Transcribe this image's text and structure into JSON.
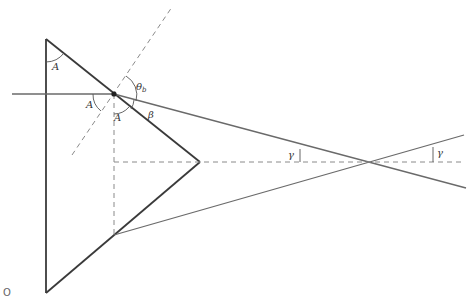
{
  "diagram": {
    "labels": {
      "apex_angle_top": "A",
      "apex_angle_left": "A",
      "apex_angle_bottom": "A",
      "theta_b": "θ",
      "theta_b_sub": "b",
      "beta": "β",
      "gamma_left": "γ",
      "gamma_right": "γ",
      "origin": "O"
    },
    "colors": {
      "prism": "#3a3a3a",
      "ray": "#6a6a6a",
      "dashed": "#8a8a8a"
    }
  }
}
